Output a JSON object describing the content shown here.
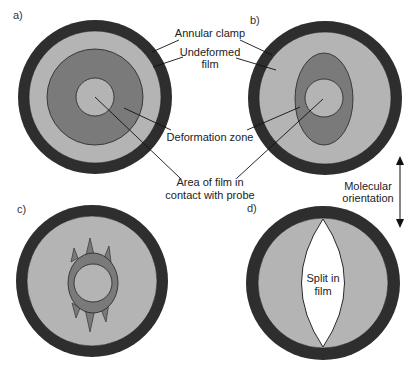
{
  "panels": {
    "a": {
      "label": "a)"
    },
    "b": {
      "label": "b)"
    },
    "c": {
      "label": "c)"
    },
    "d": {
      "label": "d)"
    }
  },
  "labels": {
    "annular_clamp": "Annular clamp",
    "undeformed_film_line1": "Undeformed",
    "undeformed_film_line2": "film",
    "deformation_zone": "Deformation zone",
    "contact_area_line1": "Area of film in",
    "contact_area_line2": "contact with probe",
    "molecular_orientation_line1": "Molecular",
    "molecular_orientation_line2": "orientation",
    "split_line1": "Split in",
    "split_line2": "film"
  },
  "colors": {
    "clamp": "#2e2e2e",
    "undeformed_film": "#b4b4b4",
    "deformation_zone": "#7a7a7a",
    "contact_area": "#b4b4b4",
    "split": "#ffffff",
    "background": "#ffffff"
  }
}
